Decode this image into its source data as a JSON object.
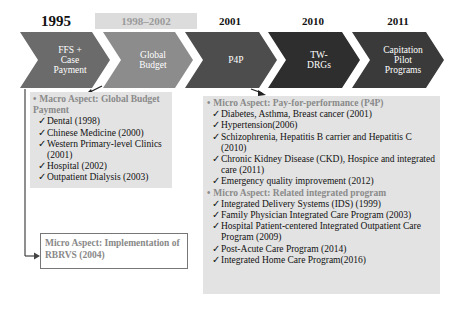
{
  "timeline": {
    "years": [
      {
        "label": "1995"
      },
      {
        "label": "1998–2002"
      },
      {
        "label": "2001"
      },
      {
        "label": "2010"
      },
      {
        "label": "2011"
      }
    ],
    "stages": [
      {
        "line1": "FFS +",
        "line2": "Case",
        "line3": "Payment",
        "color": "#6b6b6b"
      },
      {
        "line1": "Global",
        "line2": "Budget",
        "line3": "",
        "color": "#8c8c8c"
      },
      {
        "line1": "P4P",
        "line2": "",
        "line3": "",
        "color": "#4d4d4d"
      },
      {
        "line1": "TW-",
        "line2": "DRGs",
        "line3": "",
        "color": "#2e2e2e"
      },
      {
        "line1": "Capitation",
        "line2": "Pilot",
        "line3": "Programs",
        "color": "#3a3a3a"
      }
    ]
  },
  "macro": {
    "bullet": "•",
    "heading": "Macro Aspect: Global Budget Payment",
    "check": "✓",
    "items": [
      {
        "text": "Dental (1998)"
      },
      {
        "text": "Chinese Medicine (2000)"
      },
      {
        "text": "Western Primary-level Clinics (2001)"
      },
      {
        "text": "Hospital (2002)"
      },
      {
        "text": "Outpatient Dialysis (2003)"
      }
    ]
  },
  "rbrvs": {
    "text": "Micro Aspect: Implementation of RBRVS (2004)"
  },
  "micro": {
    "p4p_heading": "Micro Aspect: Pay-for-performance (P4P)",
    "p4p_items": [
      {
        "text": "Diabetes, Asthma, Breast cancer (2001)"
      },
      {
        "text": "Hypertension(2006)"
      },
      {
        "text": "Schizophrenia, Hepatitis B carrier and Hepatitis C (2010)"
      },
      {
        "text": "Chronic Kidney Disease (CKD), Hospice and integrated care (2011)"
      },
      {
        "text": "Emergency quality improvement (2012)"
      }
    ],
    "integrated_heading": "Micro Aspect: Related integrated program",
    "integrated_items": [
      {
        "text": "Integrated Delivery Systems (IDS) (1999)"
      },
      {
        "text": "Family Physician Integrated Care Program (2003)"
      },
      {
        "text": "Hospital Patient-centered Integrated Outpatient Care Program (2009)"
      },
      {
        "text": "Post-Acute Care Program (2014)"
      },
      {
        "text": "Integrated Home Care Program(2016)"
      }
    ]
  }
}
